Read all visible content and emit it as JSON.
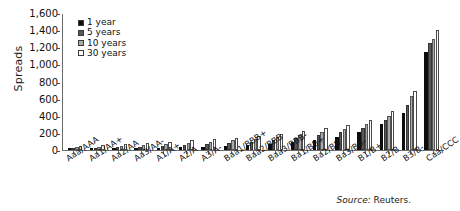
{
  "chart_data": {
    "type": "bar",
    "title": "",
    "xlabel": "",
    "ylabel": "Spreads",
    "ylim": [
      0,
      1600
    ],
    "ytick_step": 200,
    "grid": false,
    "legend_position": "top-left",
    "categories": [
      "Aaa/AAA",
      "Aa1/AA+",
      "Aa2/AA",
      "Aa3/AA-",
      "A1/A+",
      "A2/A",
      "A3/A-",
      "Baa1/BBB+",
      "Baa2/BBB",
      "Baa3/BBB-",
      "Ba1/BB+",
      "Ba2/BB",
      "Ba3/BB-",
      "B1/B+",
      "B2/B",
      "B3/B-",
      "Caa/CCC"
    ],
    "yticks": [
      "0",
      "200",
      "400",
      "600",
      "800",
      "1,000",
      "1,200",
      "1,400",
      "1,600"
    ],
    "series": [
      {
        "name": "1 year",
        "color": "#0d0d0d",
        "values": [
          5,
          10,
          14,
          18,
          24,
          30,
          38,
          48,
          58,
          70,
          90,
          115,
          150,
          210,
          300,
          430,
          1150
        ]
      },
      {
        "name": "5 years",
        "color": "#595959",
        "values": [
          18,
          25,
          32,
          40,
          48,
          58,
          70,
          84,
          98,
          115,
          140,
          170,
          205,
          260,
          350,
          530,
          1250
        ]
      },
      {
        "name": "10 years",
        "color": "#aaaaaa",
        "values": [
          30,
          40,
          50,
          60,
          70,
          82,
          96,
          112,
          128,
          150,
          178,
          210,
          248,
          300,
          400,
          630,
          1300
        ]
      },
      {
        "name": "30 years",
        "color": "#ffffff",
        "values": [
          48,
          60,
          72,
          85,
          98,
          112,
          128,
          146,
          164,
          188,
          218,
          252,
          292,
          345,
          455,
          690,
          1400
        ]
      }
    ]
  },
  "legend": {
    "items": [
      {
        "label": "1 year"
      },
      {
        "label": "5 years"
      },
      {
        "label": "10 years"
      },
      {
        "label": "30 years"
      }
    ]
  },
  "source": {
    "prefix": "Source:",
    "value": "Reuters."
  }
}
